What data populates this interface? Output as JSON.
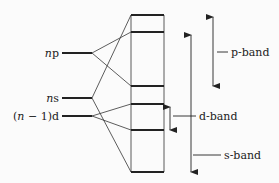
{
  "diagram": {
    "type": "band-formation",
    "atomic_levels": [
      {
        "id": "np",
        "prefix": "n",
        "suffix": "p",
        "y": 53
      },
      {
        "id": "ns",
        "prefix": "n",
        "suffix": "s",
        "y": 98
      },
      {
        "id": "n1d",
        "pre": "(",
        "prefix": "n",
        "suffix": " − 1)d",
        "y": 116
      }
    ],
    "band_box": {
      "x": 131,
      "width": 33,
      "top": 15,
      "bottom": 172
    },
    "band_lines_y": [
      15,
      32,
      86,
      104,
      130,
      172
    ],
    "bands": [
      {
        "label": "p-band"
      },
      {
        "label": "d-band"
      },
      {
        "label": "s-band"
      }
    ],
    "colors": {
      "line": "#222222",
      "background": "#fbfbfb"
    }
  }
}
